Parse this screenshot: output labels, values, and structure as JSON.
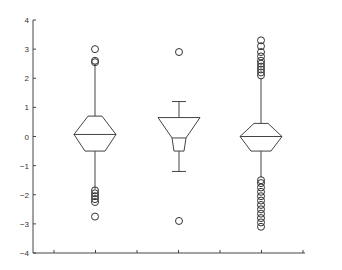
{
  "chart_data": {
    "type": "boxplot",
    "title": "",
    "xlabel": "",
    "ylabel": "",
    "ylim": [
      -4,
      4
    ],
    "yticks": [
      4,
      3,
      2,
      1,
      0,
      -1,
      -2,
      -3,
      -4
    ],
    "ytick_labels": [
      "4",
      "3",
      "2",
      "1",
      "0",
      "−1",
      "−2",
      "−3",
      "−4"
    ],
    "xticks_count": 7,
    "grid": false,
    "notched": true,
    "series": [
      {
        "name": "Group 1",
        "median": 0.07,
        "q1": -0.5,
        "q3": 0.7,
        "notch_low": -0.05,
        "notch_high": 0.2,
        "whisker_low": -1.8,
        "whisker_high": 2.5,
        "outliers": [
          3.0,
          2.6,
          2.55,
          -1.85,
          -1.95,
          -2.05,
          -2.15,
          -2.25,
          -2.75
        ]
      },
      {
        "name": "Group 2",
        "median": 0.65,
        "q1": -0.5,
        "q3": 0.65,
        "notch_low": -0.05,
        "notch_high": 0.65,
        "whisker_low": -1.2,
        "whisker_high": 1.2,
        "outliers": [
          2.9,
          -2.9
        ]
      },
      {
        "name": "Group 3",
        "median": 0.0,
        "q1": -0.5,
        "q3": 0.45,
        "notch_low": -0.45,
        "notch_high": 0.45,
        "whisker_low": -1.4,
        "whisker_high": 2.0,
        "outliers": [
          3.3,
          3.1,
          2.9,
          2.75,
          2.6,
          2.5,
          2.4,
          2.3,
          2.2,
          2.1,
          -1.5,
          -1.6,
          -1.75,
          -1.9,
          -2.05,
          -2.2,
          -2.35,
          -2.5,
          -2.65,
          -2.8,
          -2.95,
          -3.1
        ]
      }
    ]
  }
}
